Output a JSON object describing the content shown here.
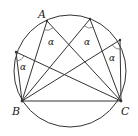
{
  "diagram": {
    "type": "geometry",
    "circle": {
      "cx": 70,
      "cy": 71,
      "r": 56
    },
    "points": {
      "A": {
        "label": "A",
        "x": 47,
        "y": 21
      },
      "P2": {
        "label": "",
        "x": 90,
        "y": 19
      },
      "P3": {
        "label": "",
        "x": 120,
        "y": 40
      },
      "P4": {
        "label": "",
        "x": 16,
        "y": 52
      },
      "B": {
        "label": "B",
        "x": 22,
        "y": 101
      },
      "C": {
        "label": "C",
        "x": 121,
        "y": 101
      }
    },
    "angle_label": "α",
    "angle_labels": [
      {
        "text": "α",
        "x": 51,
        "y": 44
      },
      {
        "text": "α",
        "x": 87,
        "y": 44
      },
      {
        "text": "α",
        "x": 113,
        "y": 60
      },
      {
        "text": "α",
        "x": 23,
        "y": 69
      }
    ],
    "colors": {
      "stroke": "#333333",
      "label": "#222222"
    }
  }
}
